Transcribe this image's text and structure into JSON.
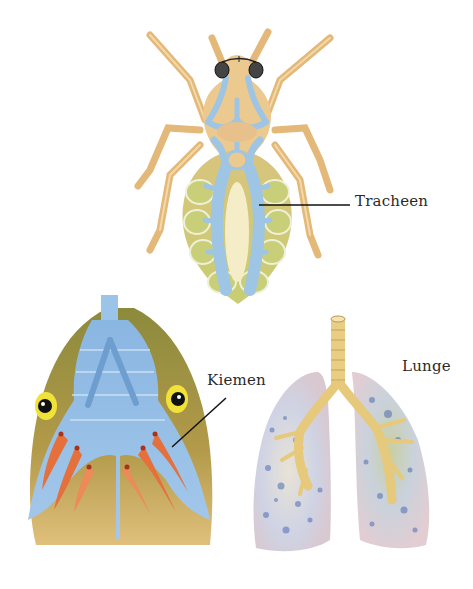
{
  "diagram": {
    "labels": {
      "tracheen": "Tracheen",
      "kiemen": "Kiemen",
      "lunge": "Lunge"
    },
    "figures": [
      {
        "name": "insect",
        "label_key": "tracheen"
      },
      {
        "name": "fish-head",
        "label_key": "kiemen"
      },
      {
        "name": "lungs",
        "label_key": "lunge"
      }
    ],
    "colors": {
      "insect_body": "#e8c48a",
      "insect_abdomen": "#c9c777",
      "trachea_blue": "#9cc3e0",
      "fish_skin": "#9a8a3a",
      "fish_water": "#8fb8e0",
      "gill_red": "#e06a3a",
      "eye_yellow": "#f2e03a",
      "lung_tissue": "#d8d4dc",
      "lung_spots": "#4a68b0",
      "bronchi": "#e8cc80"
    }
  }
}
